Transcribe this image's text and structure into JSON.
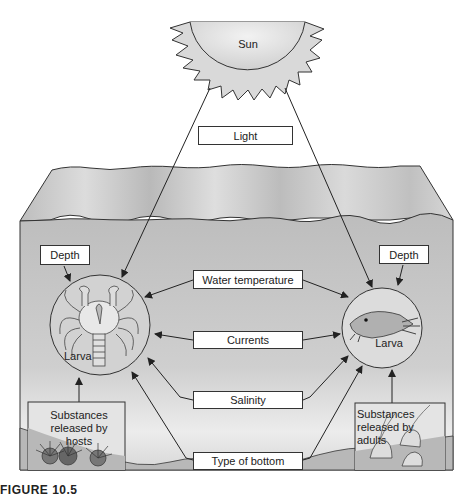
{
  "diagram": {
    "sun": {
      "label": "Sun",
      "fill": "#e6e6e6"
    },
    "ocean": {
      "surface_color": "#cfcfcf",
      "water_color": "#c4c4c4",
      "bottom_color": "#b5b5b5"
    },
    "factors": {
      "light": "Light",
      "water_temperature": "Water temperature",
      "currents": "Currents",
      "salinity": "Salinity",
      "type_of_bottom": "Type of bottom",
      "depth_left": "Depth",
      "depth_right": "Depth"
    },
    "organisms": {
      "crab_larva_label": "Larva",
      "barnacle_larva_label": "Larva"
    },
    "sources": {
      "hosts": "Substances released by hosts",
      "adults": "Substances released by adults"
    }
  },
  "caption": "FIGURE 10.5"
}
